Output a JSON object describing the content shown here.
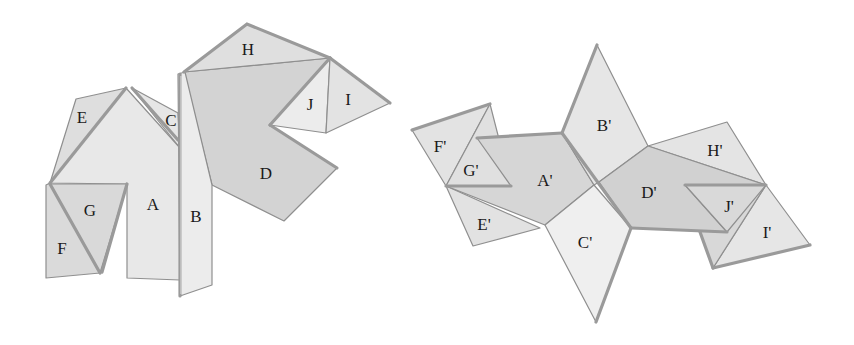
{
  "figure": {
    "colors": {
      "background": "#ffffff",
      "light_face": "#e9e9e9",
      "mid_face": "#dedede",
      "dark_face": "#cfcfcf",
      "edge": "#9a9a9a",
      "outline": "#8f8f8f"
    },
    "folded_model": {
      "labels": {
        "A": "A",
        "B": "B",
        "C": "C",
        "D": "D",
        "E": "E",
        "F": "F",
        "G": "G",
        "H": "H",
        "I": "I",
        "J": "J"
      }
    },
    "unfolded_net": {
      "labels": {
        "A": "A'",
        "B": "B'",
        "C": "C'",
        "D": "D'",
        "E": "E'",
        "F": "F'",
        "G": "G'",
        "H": "H'",
        "I": "I'",
        "J": "J'"
      }
    }
  }
}
